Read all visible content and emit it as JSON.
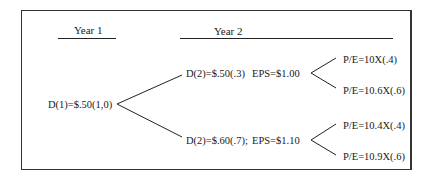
{
  "headers": {
    "year1": "Year 1",
    "year2": "Year 2"
  },
  "root": {
    "label": "D(1)=$.50(1,0)"
  },
  "branches": [
    {
      "dividend": "D(2)=$.50(.3)",
      "eps": "EPS=$1.00",
      "outcomes": [
        "P/E=10X(.4)",
        "P/E=10.6X(.6)"
      ]
    },
    {
      "dividend": "D(2)=$.60(.7);",
      "eps": "EPS=$1.10",
      "outcomes": [
        "P/E=10.4X(.4)",
        "P/E=10.9X(.6)"
      ]
    }
  ]
}
